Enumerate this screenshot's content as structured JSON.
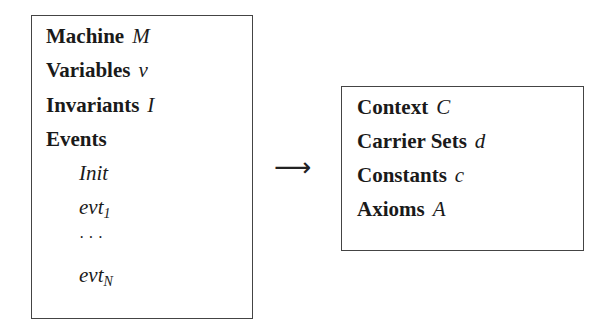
{
  "machine": {
    "rows": [
      {
        "keyword": "Machine",
        "symbol": "M"
      },
      {
        "keyword": "Variables",
        "symbol": "v"
      },
      {
        "keyword": "Invariants",
        "symbol": "I"
      },
      {
        "keyword": "Events",
        "symbol": ""
      }
    ],
    "events": [
      {
        "name": "Init",
        "sub": ""
      },
      {
        "name": "evt",
        "sub": "1"
      },
      {
        "name": "· · ·",
        "sub": ""
      },
      {
        "name": "evt",
        "sub": "N"
      }
    ]
  },
  "arrow": "⟶",
  "context": {
    "rows": [
      {
        "keyword": "Context",
        "symbol": "C"
      },
      {
        "keyword": "Carrier Sets",
        "symbol": "d"
      },
      {
        "keyword": "Constants",
        "symbol": "c"
      },
      {
        "keyword": "Axioms",
        "symbol": "A"
      }
    ]
  }
}
